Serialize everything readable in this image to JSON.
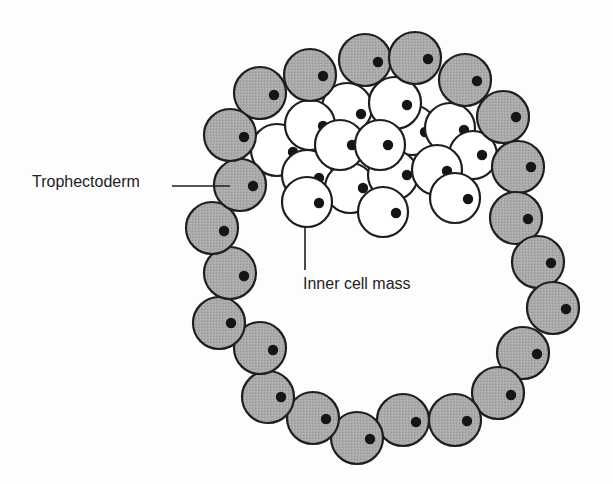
{
  "diagram": {
    "labels": {
      "trophectoderm": "Trophectoderm",
      "inner_cell_mass": "Inner cell mass"
    },
    "colors": {
      "background": "#fdfdfd",
      "trophectoderm_fill": "#a9a9a9",
      "inner_cell_fill": "#ffffff",
      "stroke": "#1e1e1e",
      "nucleus": "#151515",
      "text": "#222222"
    },
    "leader_lines": [
      {
        "name": "trophectoderm-leader",
        "x1": 172,
        "y1": 186,
        "x2": 230,
        "y2": 186
      },
      {
        "name": "inner-cell-mass-leader",
        "x1": 305,
        "y1": 226,
        "x2": 305,
        "y2": 270
      }
    ],
    "inner_cell_mass_cells": [
      {
        "cx": 347,
        "cy": 108,
        "r": 25,
        "nx": 361,
        "ny": 114
      },
      {
        "cx": 412,
        "cy": 130,
        "r": 25,
        "nx": 425,
        "ny": 132
      },
      {
        "cx": 395,
        "cy": 103,
        "r": 26,
        "nx": 407,
        "ny": 105
      },
      {
        "cx": 450,
        "cy": 128,
        "r": 25,
        "nx": 464,
        "ny": 130
      },
      {
        "cx": 473,
        "cy": 155,
        "r": 24,
        "nx": 482,
        "ny": 155
      },
      {
        "cx": 277,
        "cy": 150,
        "r": 26,
        "nx": 293,
        "ny": 152
      },
      {
        "cx": 307,
        "cy": 175,
        "r": 25,
        "nx": 319,
        "ny": 178
      },
      {
        "cx": 350,
        "cy": 188,
        "r": 25,
        "nx": 363,
        "ny": 188
      },
      {
        "cx": 393,
        "cy": 175,
        "r": 25,
        "nx": 407,
        "ny": 175
      },
      {
        "cx": 437,
        "cy": 170,
        "r": 25,
        "nx": 447,
        "ny": 171
      },
      {
        "cx": 310,
        "cy": 125,
        "r": 25,
        "nx": 323,
        "ny": 126
      },
      {
        "cx": 340,
        "cy": 145,
        "r": 25,
        "nx": 352,
        "ny": 145
      },
      {
        "cx": 380,
        "cy": 145,
        "r": 25,
        "nx": 388,
        "ny": 145
      },
      {
        "cx": 307,
        "cy": 202,
        "r": 25,
        "nx": 319,
        "ny": 203
      },
      {
        "cx": 383,
        "cy": 212,
        "r": 25,
        "nx": 396,
        "ny": 213
      },
      {
        "cx": 455,
        "cy": 198,
        "r": 25,
        "nx": 468,
        "ny": 199
      }
    ],
    "trophectoderm_cells": [
      {
        "cx": 260,
        "cy": 93,
        "r": 26,
        "nx": 274,
        "ny": 95
      },
      {
        "cx": 310,
        "cy": 75,
        "r": 26,
        "nx": 323,
        "ny": 76
      },
      {
        "cx": 365,
        "cy": 60,
        "r": 26,
        "nx": 378,
        "ny": 62
      },
      {
        "cx": 415,
        "cy": 58,
        "r": 26,
        "nx": 428,
        "ny": 59
      },
      {
        "cx": 465,
        "cy": 80,
        "r": 26,
        "nx": 477,
        "ny": 81
      },
      {
        "cx": 503,
        "cy": 117,
        "r": 26,
        "nx": 516,
        "ny": 117
      },
      {
        "cx": 518,
        "cy": 167,
        "r": 26,
        "nx": 531,
        "ny": 167
      },
      {
        "cx": 516,
        "cy": 218,
        "r": 26,
        "nx": 528,
        "ny": 219
      },
      {
        "cx": 538,
        "cy": 262,
        "r": 26,
        "nx": 551,
        "ny": 263
      },
      {
        "cx": 553,
        "cy": 308,
        "r": 26,
        "nx": 566,
        "ny": 309
      },
      {
        "cx": 523,
        "cy": 353,
        "r": 26,
        "nx": 537,
        "ny": 354
      },
      {
        "cx": 498,
        "cy": 393,
        "r": 26,
        "nx": 511,
        "ny": 395
      },
      {
        "cx": 455,
        "cy": 420,
        "r": 26,
        "nx": 467,
        "ny": 421
      },
      {
        "cx": 403,
        "cy": 420,
        "r": 26,
        "nx": 416,
        "ny": 422
      },
      {
        "cx": 357,
        "cy": 438,
        "r": 26,
        "nx": 370,
        "ny": 439
      },
      {
        "cx": 313,
        "cy": 418,
        "r": 26,
        "nx": 326,
        "ny": 419
      },
      {
        "cx": 268,
        "cy": 397,
        "r": 26,
        "nx": 281,
        "ny": 397
      },
      {
        "cx": 260,
        "cy": 348,
        "r": 26,
        "nx": 273,
        "ny": 350
      },
      {
        "cx": 219,
        "cy": 323,
        "r": 26,
        "nx": 231,
        "ny": 323
      },
      {
        "cx": 230,
        "cy": 273,
        "r": 26,
        "nx": 244,
        "ny": 276
      },
      {
        "cx": 212,
        "cy": 228,
        "r": 26,
        "nx": 224,
        "ny": 231
      },
      {
        "cx": 240,
        "cy": 185,
        "r": 26,
        "nx": 253,
        "ny": 186
      },
      {
        "cx": 230,
        "cy": 135,
        "r": 26,
        "nx": 244,
        "ny": 137
      }
    ]
  }
}
